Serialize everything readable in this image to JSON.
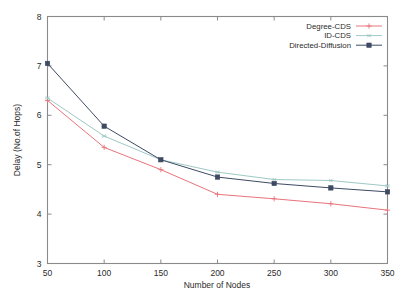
{
  "chart_data": {
    "type": "line",
    "title": "",
    "xlabel": "Number of Nodes",
    "ylabel": "Delay (No.of Hops)",
    "x": [
      50,
      100,
      150,
      200,
      250,
      300,
      350
    ],
    "xlim": [
      50,
      350
    ],
    "ylim": [
      3,
      8
    ],
    "xticks": [
      50,
      100,
      150,
      200,
      250,
      300,
      350
    ],
    "yticks": [
      3,
      4,
      5,
      6,
      7,
      8
    ],
    "grid": false,
    "legend_position": "top-right-inside",
    "series": [
      {
        "name": "Degree-CDS",
        "color": "#e8747c",
        "marker": "plus",
        "values": [
          6.3,
          5.35,
          4.9,
          4.4,
          4.31,
          4.21,
          4.08
        ]
      },
      {
        "name": "ID-CDS",
        "color": "#9ec9c4",
        "marker": "star",
        "values": [
          6.35,
          5.58,
          5.1,
          4.85,
          4.7,
          4.68,
          4.57
        ]
      },
      {
        "name": "Directed-Diffusion",
        "color": "#3e4a63",
        "marker": "filled-square",
        "values": [
          7.05,
          5.78,
          5.1,
          4.75,
          4.62,
          4.53,
          4.45
        ]
      }
    ]
  },
  "axes": {
    "x_tick_labels": [
      "50",
      "100",
      "150",
      "200",
      "250",
      "300",
      "350"
    ],
    "y_tick_labels": [
      "3",
      "4",
      "5",
      "6",
      "7",
      "8"
    ],
    "x_axis_label": "Number of Nodes",
    "y_axis_label": "Delay (No.of Hops)"
  },
  "legend": {
    "entries": [
      {
        "label": "Degree-CDS"
      },
      {
        "label": "ID-CDS"
      },
      {
        "label": "Directed-Diffusion"
      }
    ]
  },
  "style": {
    "frame_color": "#8a8a8a",
    "background": "#ffffff",
    "text_color": "#2b2b2b"
  }
}
